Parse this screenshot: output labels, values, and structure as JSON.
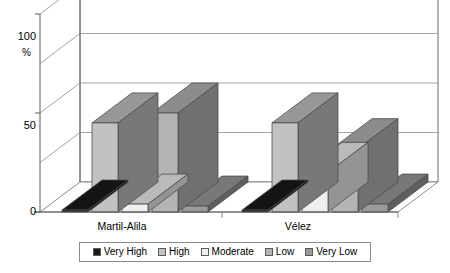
{
  "chart_data": {
    "type": "bar",
    "title": "",
    "subtitle": "",
    "xlabel": "",
    "ylabel": "%",
    "ylim": [
      0,
      100
    ],
    "yticks": [
      0,
      50,
      100
    ],
    "ytick_labels": [
      "0",
      "50",
      "100"
    ],
    "gridlines": [
      25,
      50,
      75,
      100
    ],
    "grid": true,
    "three_d": true,
    "legend_position": "bottom",
    "categories": [
      "Martil-Alila",
      "Vélez"
    ],
    "series": [
      {
        "name": "Very High",
        "color": "#1a1a1a",
        "values": [
          1,
          1
        ]
      },
      {
        "name": "High",
        "color": "#c2c2c2",
        "values": [
          45,
          45
        ]
      },
      {
        "name": "Moderate",
        "color": "#efefef",
        "values": [
          4,
          20
        ]
      },
      {
        "name": "Low",
        "color": "#b4b4b4",
        "values": [
          50,
          32
        ]
      },
      {
        "name": "Very Low",
        "color": "#9a9a9a",
        "values": [
          3,
          4
        ]
      }
    ]
  },
  "axis": {
    "y_top_label": "100",
    "y_mid_label": "50",
    "y_zero_label": "0",
    "percent_symbol": "%"
  },
  "categories": {
    "first": "Martil-Alila",
    "second": "Vélez"
  },
  "legend": {
    "items": [
      {
        "label": "Very High",
        "color": "#1a1a1a"
      },
      {
        "label": "High",
        "color": "#c2c2c2"
      },
      {
        "label": "Moderate",
        "color": "#efefef"
      },
      {
        "label": "Low",
        "color": "#b4b4b4"
      },
      {
        "label": "Very Low",
        "color": "#9a9a9a"
      }
    ]
  }
}
